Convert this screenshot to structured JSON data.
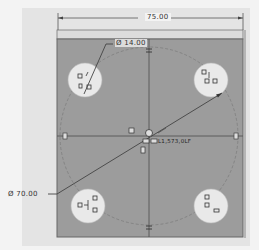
{
  "sketch": {
    "plate": {
      "width_label": "75.00",
      "fill": "#9c9c9c",
      "band_fill": "#d9d9d9"
    },
    "holes": [
      {
        "id": "top-left",
        "cx": 85,
        "cy": 80,
        "r": 16
      },
      {
        "id": "top-right",
        "cx": 211,
        "cy": 80,
        "r": 16
      },
      {
        "id": "bottom-left",
        "cx": 88,
        "cy": 206,
        "r": 16
      },
      {
        "id": "bottom-right",
        "cx": 211,
        "cy": 206,
        "r": 16
      }
    ],
    "hole_color": "#e9e9e9",
    "dimensions": {
      "overall_width": "75.00",
      "hole_diameter": "Ø 14.00",
      "bolt_circle_diameter": "Ø 70.00"
    },
    "origin_label": "L1,573,0LF",
    "constraint_symbols": {
      "equal": "=",
      "horizontal": "H",
      "vertical": "V",
      "tangent": "T"
    },
    "colors": {
      "line": "#444444",
      "construction": "#6a6a6a",
      "background": "#f3f3f3",
      "frame": "#e4e4e4"
    }
  }
}
